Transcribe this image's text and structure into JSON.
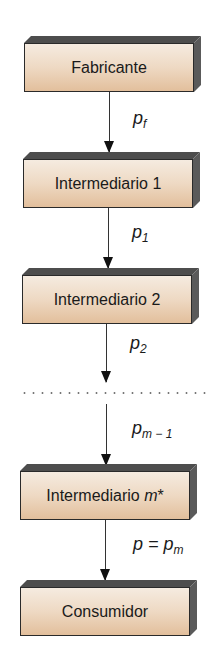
{
  "diagram": {
    "boxes": [
      {
        "label": "Fabricante"
      },
      {
        "label": "Intermediario 1"
      },
      {
        "label": "Intermediario 2"
      },
      {
        "label_prefix": "Intermediario ",
        "label_italic": "m",
        "label_suffix": "*"
      },
      {
        "label": "Consumidor"
      }
    ],
    "arrows": [
      {
        "label_main": "p",
        "label_sub": "f"
      },
      {
        "label_main": "p",
        "label_sub": "1"
      },
      {
        "label_main": "p",
        "label_sub": "2"
      },
      {
        "label_main": "p",
        "label_sub": "m − 1"
      },
      {
        "label_main": "p = p",
        "label_sub": "m"
      }
    ],
    "ellipsis": "dotted-separator",
    "colors": {
      "box_top": "#f5ebe0",
      "box_bottom": "#e2bf9c",
      "box_depth": "#4d4d4d",
      "border": "#2a2a2a",
      "arrow": "#333333"
    }
  }
}
